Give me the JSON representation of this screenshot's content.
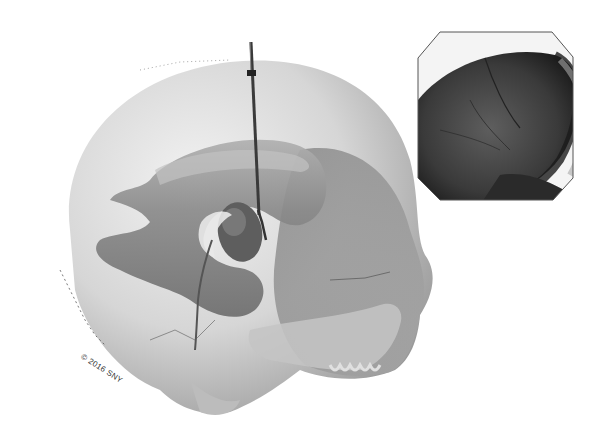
{
  "figure": {
    "watermark": "© 2016 SNY",
    "main_view": {
      "label": "skull-with-ventricles",
      "colors": {
        "skull": "#d8d8d8",
        "skull_shadow": "#8e8e8e",
        "ventricle": "#7a7a7a",
        "ventricle_dark": "#5a5a5a",
        "catheter": "#2a2a2a"
      }
    },
    "inset": {
      "label": "endoscopic-ventricle-view",
      "colors": {
        "border": "#555555",
        "interior": "#2e2e2e",
        "highlight": "#bdbdbd"
      }
    }
  }
}
